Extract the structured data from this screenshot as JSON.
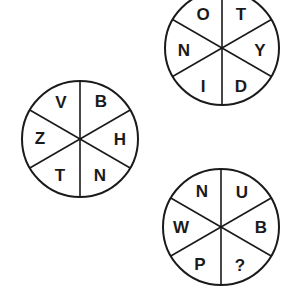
{
  "puzzle": {
    "colors": {
      "ink": "#1a1a1a",
      "background": "#ffffff"
    },
    "circles": [
      {
        "id": "top-right",
        "segments": {
          "top_left": "O",
          "top_right": "T",
          "right": "Y",
          "bottom_right": "D",
          "bottom_left": "I",
          "left": "N"
        }
      },
      {
        "id": "left",
        "segments": {
          "top_left": "V",
          "top_right": "B",
          "right": "H",
          "bottom_right": "N",
          "bottom_left": "T",
          "left": "Z"
        }
      },
      {
        "id": "bottom-right",
        "segments": {
          "top_left": "N",
          "top_right": "U",
          "right": "B",
          "bottom_right": "?",
          "bottom_left": "P",
          "left": "W"
        }
      }
    ]
  }
}
